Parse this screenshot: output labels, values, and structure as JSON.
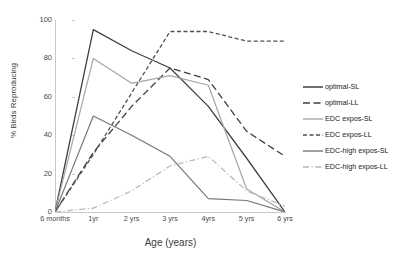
{
  "chart_data": {
    "type": "line",
    "title": "",
    "xlabel": "Age (years)",
    "ylabel": "% Birds Reproducing",
    "categories": [
      "6 months",
      "1yr",
      "2 yrs",
      "3 yrs",
      "4yrs",
      "5 yrs",
      "6 yrs"
    ],
    "ylim": [
      0,
      100
    ],
    "yticks": [
      0,
      20,
      40,
      60,
      80,
      100
    ],
    "grid": false,
    "legend_position": "right",
    "series": [
      {
        "name": "optimal-SL",
        "style": "solid",
        "color": "#3f3f3f",
        "width": 1.3,
        "values": [
          0,
          95,
          84,
          75,
          55,
          28,
          0
        ]
      },
      {
        "name": "optimal-LL",
        "style": "long-dash",
        "color": "#3f3f3f",
        "width": 1.3,
        "values": [
          0,
          31,
          55,
          75,
          69,
          42,
          29
        ]
      },
      {
        "name": "EDC expos-SL",
        "style": "solid",
        "color": "#a6a6a6",
        "width": 1.2,
        "values": [
          0,
          80,
          67,
          71,
          66,
          12,
          0
        ]
      },
      {
        "name": "EDC expos-LL",
        "style": "short-dash",
        "color": "#4f4f4f",
        "width": 1.3,
        "values": [
          0,
          30,
          62,
          94,
          94,
          89,
          89
        ]
      },
      {
        "name": "EDC-high expos-SL",
        "style": "solid",
        "color": "#777777",
        "width": 1.2,
        "values": [
          0,
          50,
          40,
          29,
          7,
          6,
          0
        ]
      },
      {
        "name": "EDC-high expos-LL",
        "style": "dash-dot",
        "color": "#b5b5b5",
        "width": 1.2,
        "values": [
          0,
          2,
          11,
          24,
          29,
          11,
          3
        ]
      }
    ]
  },
  "axis": {
    "y_tick_labels": [
      "0",
      "20",
      "40",
      "60",
      "80",
      "100"
    ],
    "x_tick_labels": [
      "6 months",
      "1yr",
      "2 yrs",
      "3 yrs",
      "4yrs",
      "5 yrs",
      "6 yrs"
    ],
    "y_title": "% Birds Reproducing",
    "x_title": "Age (years)"
  },
  "legend": {
    "items": [
      {
        "label": "optimal-SL"
      },
      {
        "label": "optimal-LL"
      },
      {
        "label": "EDC expos-SL"
      },
      {
        "label": "EDC expos-LL"
      },
      {
        "label": "EDC-high expos-SL"
      },
      {
        "label": "EDC-high expos-LL"
      }
    ]
  }
}
